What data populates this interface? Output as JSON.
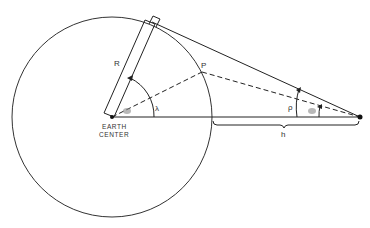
{
  "diagram": {
    "labels": {
      "radius": "R",
      "earth_center_line1": "EARTH",
      "earth_center_line2": "CENTER",
      "central_angle": "λ",
      "target_point": "P",
      "angular_radius": "ρ",
      "altitude": "h"
    },
    "colors": {
      "stroke": "#222222",
      "background": "#ffffff"
    }
  }
}
